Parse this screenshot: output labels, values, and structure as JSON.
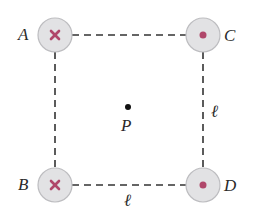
{
  "diagram": {
    "colors": {
      "wire_fill": "#e2e2e4",
      "wire_stroke": "#bdbdc0",
      "symbol": "#b0476a",
      "line": "#333333",
      "text": "#2a2a2a"
    },
    "wires": [
      {
        "id": "A",
        "label": "A",
        "direction": "into page",
        "symbol": "cross"
      },
      {
        "id": "C",
        "label": "C",
        "direction": "out of page",
        "symbol": "dot"
      },
      {
        "id": "B",
        "label": "B",
        "direction": "into page",
        "symbol": "cross"
      },
      {
        "id": "D",
        "label": "D",
        "direction": "out of page",
        "symbol": "dot"
      }
    ],
    "center_point": {
      "label": "P"
    },
    "side_labels": {
      "right": "ℓ",
      "bottom": "ℓ"
    }
  }
}
